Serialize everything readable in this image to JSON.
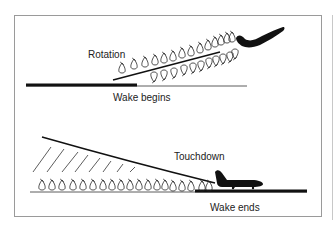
{
  "takeoff": {
    "rotation_label": "Rotation",
    "wake_label": "Wake begins"
  },
  "landing": {
    "touchdown_label": "Touchdown",
    "wake_label": "Wake ends"
  },
  "colors": {
    "ink": "#111111",
    "frame": "#9a9a9a",
    "background": "#ffffff"
  }
}
